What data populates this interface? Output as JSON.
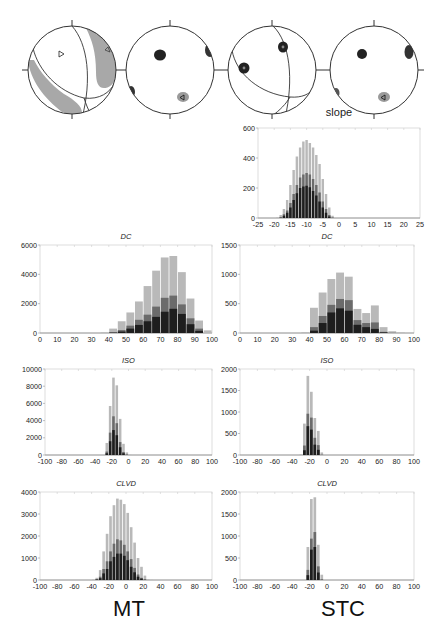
{
  "figure": {
    "column_labels": [
      "MT",
      "STC"
    ],
    "beachballs": [
      {
        "name": "mt-focal-mechanism",
        "description": "focal mechanism with shaded compressional lobes, P and T markers"
      },
      {
        "name": "mt-pt-axes-density",
        "description": "P/T/N axes density clusters"
      },
      {
        "name": "stc-focal-mechanism",
        "description": "nodal planes with axis clusters"
      },
      {
        "name": "stc-pt-axes-density",
        "description": "P/T/N axes density clusters"
      }
    ],
    "colors": {
      "light": "#b9b9b9",
      "mid": "#6b6b6b",
      "dark": "#1e1e1e",
      "frame": "#cfcfcf"
    }
  },
  "chart_data": [
    {
      "id": "slope",
      "type": "bar",
      "title": "slope",
      "xlabel": "",
      "ylabel": "",
      "xlim": [
        -25,
        25
      ],
      "ylim": [
        0,
        600
      ],
      "xticks": [
        -25,
        -20,
        -15,
        -10,
        -5,
        0,
        5,
        10,
        15,
        20,
        25
      ],
      "yticks": [
        0,
        200,
        400,
        600
      ],
      "bin_width": 1,
      "x": [
        -19,
        -18,
        -17,
        -16,
        -15,
        -14,
        -13,
        -12,
        -11,
        -10,
        -9,
        -8,
        -7,
        -6,
        -5,
        -4,
        -3,
        -2
      ],
      "series": [
        {
          "name": "total",
          "values": [
            5,
            20,
            60,
            120,
            220,
            320,
            410,
            470,
            510,
            520,
            500,
            470,
            420,
            360,
            260,
            160,
            70,
            15
          ]
        },
        {
          "name": "mid",
          "values": [
            0,
            5,
            25,
            50,
            100,
            160,
            220,
            270,
            290,
            300,
            290,
            260,
            220,
            170,
            110,
            60,
            20,
            3
          ]
        },
        {
          "name": "dark",
          "values": [
            0,
            2,
            15,
            35,
            70,
            120,
            165,
            200,
            210,
            215,
            205,
            180,
            150,
            110,
            70,
            35,
            10,
            1
          ]
        }
      ]
    },
    {
      "id": "mt-dc",
      "type": "bar",
      "title": "DC",
      "xlim": [
        0,
        100
      ],
      "ylim": [
        0,
        6000
      ],
      "xticks": [
        0,
        10,
        20,
        30,
        40,
        50,
        60,
        70,
        80,
        90,
        100
      ],
      "yticks": [
        0,
        2000,
        4000,
        6000
      ],
      "bin_width": 5,
      "x": [
        37.5,
        42.5,
        47.5,
        52.5,
        57.5,
        62.5,
        67.5,
        72.5,
        77.5,
        82.5,
        87.5,
        92.5
      ],
      "series": [
        {
          "name": "total",
          "values": [
            50,
            300,
            800,
            1400,
            2150,
            3200,
            4250,
            5150,
            5250,
            4150,
            2350,
            850
          ]
        },
        {
          "name": "mid",
          "values": [
            0,
            60,
            200,
            500,
            900,
            1250,
            1800,
            2400,
            2550,
            1950,
            1000,
            300
          ]
        },
        {
          "name": "dark",
          "values": [
            0,
            20,
            100,
            300,
            550,
            800,
            1100,
            1450,
            1650,
            1300,
            600,
            150
          ]
        }
      ],
      "extra_bin": {
        "x": 97.5,
        "total": 180,
        "mid": 0,
        "dark": 0
      }
    },
    {
      "id": "stc-dc",
      "type": "bar",
      "title": "DC",
      "xlim": [
        0,
        100
      ],
      "ylim": [
        0,
        1500
      ],
      "xticks": [
        0,
        10,
        20,
        30,
        40,
        50,
        60,
        70,
        80,
        90,
        100
      ],
      "yticks": [
        0,
        500,
        1000,
        1500
      ],
      "bin_width": 5,
      "x": [
        42.5,
        47.5,
        52.5,
        57.5,
        62.5,
        67.5,
        72.5,
        77.5,
        82.5,
        87.5,
        92.5
      ],
      "series": [
        {
          "name": "total",
          "values": [
            430,
            690,
            920,
            1030,
            960,
            410,
            340,
            470,
            100,
            30,
            10
          ]
        },
        {
          "name": "mid",
          "values": [
            100,
            290,
            480,
            580,
            560,
            220,
            170,
            180,
            20,
            5,
            0
          ]
        },
        {
          "name": "dark",
          "values": [
            40,
            170,
            350,
            420,
            380,
            140,
            100,
            70,
            10,
            0,
            0
          ]
        }
      ],
      "extra_bin": {
        "x": 37.5,
        "total": 15,
        "mid": 0,
        "dark": 0
      }
    },
    {
      "id": "mt-iso",
      "type": "bar",
      "title": "ISO",
      "xlim": [
        -100,
        100
      ],
      "ylim": [
        0,
        10000
      ],
      "xticks": [
        -100,
        -80,
        -60,
        -40,
        -20,
        0,
        20,
        40,
        60,
        80,
        100
      ],
      "yticks": [
        0,
        2000,
        4000,
        6000,
        8000,
        10000
      ],
      "bin_width": 4,
      "x": [
        -26,
        -22,
        -18,
        -14,
        -10,
        -6,
        -2,
        2
      ],
      "series": [
        {
          "name": "total",
          "values": [
            1400,
            5700,
            9000,
            8100,
            4200,
            1300,
            300,
            30
          ]
        },
        {
          "name": "mid",
          "values": [
            400,
            2600,
            4500,
            3700,
            1500,
            350,
            50,
            0
          ]
        },
        {
          "name": "dark",
          "values": [
            200,
            1600,
            2900,
            2300,
            900,
            200,
            20,
            0
          ]
        }
      ]
    },
    {
      "id": "stc-iso",
      "type": "bar",
      "title": "ISO",
      "xlim": [
        -100,
        100
      ],
      "ylim": [
        0,
        2000
      ],
      "xticks": [
        -100,
        -80,
        -60,
        -40,
        -20,
        0,
        20,
        40,
        60,
        80,
        100
      ],
      "yticks": [
        0,
        500,
        1000,
        1500,
        2000
      ],
      "bin_width": 4,
      "x": [
        -30,
        -26,
        -22,
        -18,
        -14,
        -10,
        -6
      ],
      "series": [
        {
          "name": "total",
          "values": [
            20,
            730,
            1840,
            1470,
            860,
            560,
            60
          ]
        },
        {
          "name": "mid",
          "values": [
            0,
            220,
            960,
            870,
            400,
            230,
            10
          ]
        },
        {
          "name": "dark",
          "values": [
            0,
            110,
            670,
            590,
            240,
            120,
            0
          ]
        }
      ]
    },
    {
      "id": "mt-clvd",
      "type": "bar",
      "title": "CLVD",
      "xlim": [
        -100,
        100
      ],
      "ylim": [
        0,
        4000
      ],
      "xticks": [
        -100,
        -80,
        -60,
        -40,
        -20,
        0,
        20,
        40,
        60,
        80,
        100
      ],
      "yticks": [
        0,
        1000,
        2000,
        3000,
        4000
      ],
      "bin_width": 4,
      "x": [
        -38,
        -34,
        -30,
        -26,
        -22,
        -18,
        -14,
        -10,
        -6,
        -2,
        2,
        6,
        10,
        14,
        18,
        22,
        26,
        30
      ],
      "series": [
        {
          "name": "total",
          "values": [
            30,
            100,
            450,
            1300,
            2100,
            2900,
            3400,
            3700,
            3650,
            3450,
            3050,
            2400,
            1700,
            1000,
            600,
            200,
            40,
            10
          ]
        },
        {
          "name": "mid",
          "values": [
            0,
            40,
            150,
            500,
            850,
            1300,
            1650,
            1850,
            1800,
            1600,
            1300,
            950,
            550,
            250,
            100,
            30,
            0,
            0
          ]
        },
        {
          "name": "dark",
          "values": [
            0,
            20,
            80,
            300,
            500,
            850,
            1050,
            1200,
            1200,
            1100,
            900,
            600,
            350,
            150,
            60,
            10,
            0,
            0
          ]
        }
      ]
    },
    {
      "id": "stc-clvd",
      "type": "bar",
      "title": "CLVD",
      "xlim": [
        -100,
        100
      ],
      "ylim": [
        0,
        2000
      ],
      "xticks": [
        -100,
        -80,
        -60,
        -40,
        -20,
        0,
        20,
        40,
        60,
        80,
        100
      ],
      "yticks": [
        0,
        500,
        1000,
        1500,
        2000
      ],
      "bin_width": 4,
      "x": [
        -22,
        -18,
        -14,
        -10,
        -6
      ],
      "series": [
        {
          "name": "total",
          "values": [
            750,
            1840,
            1880,
            800,
            120
          ]
        },
        {
          "name": "mid",
          "values": [
            230,
            940,
            1090,
            310,
            20
          ]
        },
        {
          "name": "dark",
          "values": [
            110,
            690,
            750,
            170,
            0
          ]
        }
      ]
    }
  ]
}
